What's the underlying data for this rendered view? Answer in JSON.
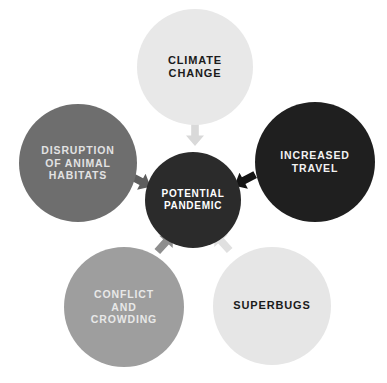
{
  "diagram": {
    "type": "radial-cause-diagram",
    "background_color": "#ffffff",
    "center": {
      "id": "potential-pandemic",
      "label": "POTENTIAL\nPANDEMIC",
      "fill_color": "#2b2b2b",
      "text_color": "#ffffff"
    },
    "nodes": [
      {
        "id": "climate-change",
        "label": "CLIMATE\nCHANGE",
        "fill_color": "#e8e8e8",
        "text_color": "#1b1b1b",
        "position": "top"
      },
      {
        "id": "disruption-of-animal-habitats",
        "label": "DISRUPTION\nOF ANIMAL\nHABITATS",
        "fill_color": "#6e6e6e",
        "text_color": "#e2e2e2",
        "position": "left"
      },
      {
        "id": "increased-travel",
        "label": "INCREASED\nTRAVEL",
        "fill_color": "#1f1f1f",
        "text_color": "#f2f2f2",
        "position": "right"
      },
      {
        "id": "conflict-and-crowding",
        "label": "CONFLICT\nAND\nCROWDING",
        "fill_color": "#9e9e9e",
        "text_color": "#e8e8e8",
        "position": "bottom-left"
      },
      {
        "id": "superbugs",
        "label": "SUPERBUGS",
        "fill_color": "#e6e6e6",
        "text_color": "#1b1b1b",
        "position": "bottom-right"
      }
    ],
    "arrows": [
      {
        "id": "arrow-climate-to-center",
        "from": "climate-change",
        "to": "potential-pandemic",
        "color": "#d9d9d9",
        "direction": "down"
      },
      {
        "id": "arrow-habitats-to-center",
        "from": "disruption-of-animal-habitats",
        "to": "potential-pandemic",
        "color": "#5e5e5e",
        "direction": "down-right"
      },
      {
        "id": "arrow-travel-to-center",
        "from": "increased-travel",
        "to": "potential-pandemic",
        "color": "#141414",
        "direction": "down-left"
      },
      {
        "id": "arrow-conflict-to-center",
        "from": "conflict-and-crowding",
        "to": "potential-pandemic",
        "color": "#8e8e8e",
        "direction": "up-right"
      },
      {
        "id": "arrow-superbugs-to-center",
        "from": "superbugs",
        "to": "potential-pandemic",
        "color": "#e0e0e0",
        "direction": "up-left"
      }
    ]
  }
}
